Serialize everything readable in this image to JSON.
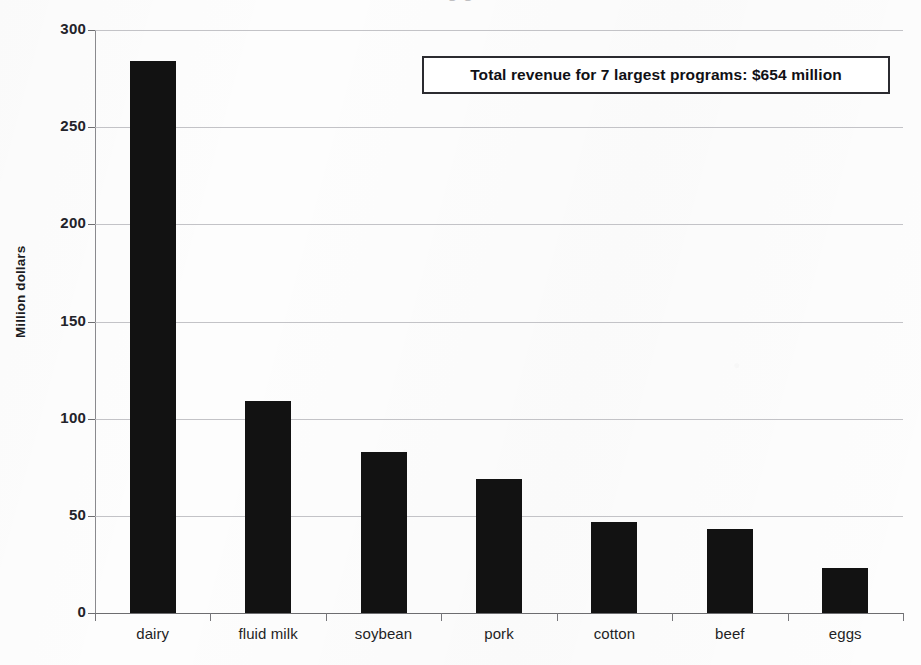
{
  "chart_data": {
    "type": "bar",
    "title": "",
    "xlabel": "",
    "ylabel": "Million dollars",
    "categories": [
      "dairy",
      "fluid milk",
      "soybean",
      "pork",
      "cotton",
      "beef",
      "eggs"
    ],
    "values": [
      284,
      109,
      83,
      69,
      47,
      43,
      23
    ],
    "ylim": [
      0,
      300
    ],
    "yticks": [
      0,
      50,
      100,
      150,
      200,
      250,
      300
    ],
    "ytick_labels": [
      "0",
      "50",
      "100",
      "150",
      "200",
      "250",
      "300"
    ],
    "grid": true,
    "legend": null,
    "legend_position": "none",
    "bar_color": "#121212",
    "annotations": [
      {
        "name": "total-revenue-note",
        "text": "Total revenue for 7 largest programs: $654 million"
      }
    ]
  },
  "chart": {
    "ylabel": "Million dollars",
    "annotation": "Total revenue for 7 largest programs: $654 million",
    "title_remnant": "g g"
  },
  "colors": {
    "bar": "#121212",
    "gridline": "#b9b9bd",
    "axis": "#6d6d70",
    "text": "#1f1f25",
    "annotation_border": "#2b2b30",
    "paper": "#fdfdfd"
  }
}
